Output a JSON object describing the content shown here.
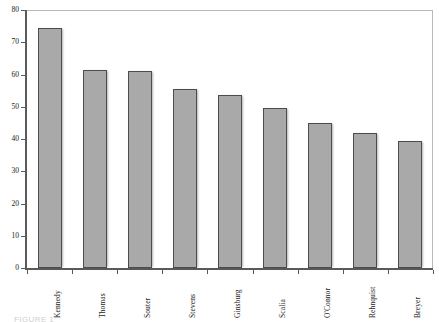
{
  "chart_data": {
    "type": "bar",
    "title": "",
    "subtitle": "",
    "xlabel": "",
    "ylabel": "",
    "categories": [
      "Kennedy",
      "Thomas",
      "Souter",
      "Stevens",
      "Ginsburg",
      "Scalia",
      "O'Connor",
      "Rehnquist",
      "Breyer"
    ],
    "values": [
      74.5,
      61.5,
      61.0,
      55.5,
      53.5,
      49.5,
      45.0,
      42.0,
      39.5
    ],
    "ylim": [
      0,
      80
    ],
    "ytick_labels": [
      "0",
      "10",
      "20",
      "30",
      "40",
      "50",
      "60",
      "70",
      "80"
    ],
    "ytick_values": [
      0,
      10,
      20,
      30,
      40,
      50,
      60,
      70,
      80
    ],
    "grid": false,
    "legend": false,
    "legend_position": "none",
    "bar_color": "#a9a9a9",
    "bar_edge_color": "#4c4c4c",
    "axis_color": "#5a5a5a",
    "frame_color": "#b9b9b9",
    "background": "#ffffff",
    "xlabel_rotation": -90
  },
  "caption": {
    "text": "FIGURE 1"
  }
}
